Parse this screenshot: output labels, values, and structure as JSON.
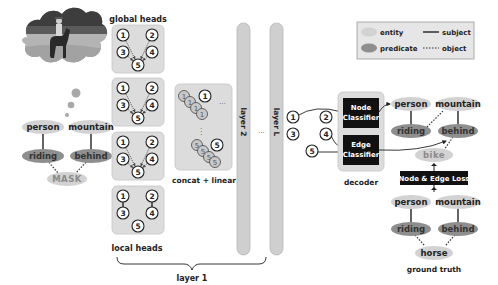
{
  "input": {
    "thought_image": "photo of a person riding a horse in a field (thought bubble)",
    "masked_graph": {
      "entities": [
        "person",
        "mountain"
      ],
      "predicates": [
        "riding",
        "behind"
      ],
      "mask_label": "MASK"
    }
  },
  "encoder": {
    "global_heads_label": "global heads",
    "local_heads_label": "local heads",
    "head_nodes": [
      "1",
      "2",
      "3",
      "4",
      "5"
    ],
    "concat_label": "concat + linear",
    "concat_top_node": "1",
    "concat_bottom_node": "5",
    "ellipsis": "...",
    "vertical_ellipsis": "⋮",
    "layer1_label": "layer 1",
    "layer2_label": "layer 2",
    "layerL_label": "layer L",
    "between_layers": "..."
  },
  "decoder": {
    "label": "decoder",
    "node_classifier": [
      "Node",
      "Classifier"
    ],
    "edge_classifier": [
      "Edge",
      "Classifier"
    ],
    "inputs": [
      "1",
      "2",
      "3",
      "4",
      "5"
    ]
  },
  "prediction": {
    "entities": [
      "person",
      "mountain"
    ],
    "predicates": [
      "riding",
      "behind"
    ],
    "predicted_object": "bike"
  },
  "loss": {
    "label": "Node & Edge Loss"
  },
  "ground_truth": {
    "label": "ground truth",
    "entities": [
      "person",
      "mountain"
    ],
    "predicates": [
      "riding",
      "behind"
    ],
    "object": "horse"
  },
  "legend": {
    "entity": "entity",
    "predicate": "predicate",
    "subject": "subject",
    "object": "object"
  },
  "colors": {
    "entity": "#d2d2d2",
    "predicate": "#8e8e8e",
    "head_box": "#dcdcdc",
    "layer_bar": "#cfcfcf",
    "classifier": "#111111"
  }
}
